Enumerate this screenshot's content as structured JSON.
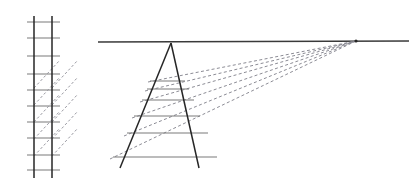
{
  "figure": {
    "type": "line-diagram",
    "canvas": {
      "width": 411,
      "height": 187,
      "background": "#ffffff"
    },
    "colors": {
      "rail": "#262626",
      "rung": "#7a7a7a",
      "horizon": "#3a3a3a",
      "construction": "#8c8c95",
      "background": "#ffffff"
    }
  },
  "orthographic_ladder": {
    "label": "elevation-view-ladder",
    "rails": [
      {
        "name": "left-rail",
        "x1": 34,
        "y1": 16,
        "x2": 34,
        "y2": 178
      },
      {
        "name": "right-rail",
        "x1": 52,
        "y1": 16,
        "x2": 52,
        "y2": 178
      }
    ],
    "rung_x_start": 27,
    "rung_x_end": 60,
    "rung_y_values": [
      22,
      38,
      56,
      74,
      90,
      106,
      122,
      138,
      155,
      170
    ],
    "diagonals": [
      {
        "x1": 34,
        "y1": 88,
        "x2": 60,
        "y2": 60
      },
      {
        "x1": 34,
        "y1": 105,
        "x2": 60,
        "y2": 77
      },
      {
        "x1": 34,
        "y1": 122,
        "x2": 60,
        "y2": 94
      },
      {
        "x1": 34,
        "y1": 139,
        "x2": 60,
        "y2": 111
      },
      {
        "x1": 34,
        "y1": 156,
        "x2": 60,
        "y2": 128
      },
      {
        "x1": 52,
        "y1": 88,
        "x2": 78,
        "y2": 60
      },
      {
        "x1": 52,
        "y1": 105,
        "x2": 78,
        "y2": 77
      },
      {
        "x1": 52,
        "y1": 122,
        "x2": 78,
        "y2": 94
      },
      {
        "x1": 52,
        "y1": 139,
        "x2": 78,
        "y2": 111
      },
      {
        "x1": 52,
        "y1": 156,
        "x2": 78,
        "y2": 128
      }
    ]
  },
  "horizon": {
    "label": "horizon-line",
    "x1": 98,
    "y1": 42,
    "x2": 409,
    "y2": 41
  },
  "vanishing_point": {
    "label": "vanishing-point",
    "x": 356,
    "y": 41
  },
  "perspective_ladder": {
    "label": "perspective-view-ladder",
    "apex": {
      "x": 171,
      "y": 43
    },
    "rails": [
      {
        "name": "left-rail-perspective",
        "x1": 171,
        "y1": 43,
        "x2": 120,
        "y2": 168
      },
      {
        "name": "right-rail-perspective",
        "x1": 171,
        "y1": 43,
        "x2": 199,
        "y2": 168
      }
    ],
    "rungs": [
      {
        "name": "rung-1",
        "x1": 150,
        "y1": 81,
        "x2": 185,
        "y2": 81
      },
      {
        "name": "rung-2",
        "x1": 147,
        "y1": 89,
        "x2": 189,
        "y2": 89
      },
      {
        "name": "rung-3",
        "x1": 142,
        "y1": 100,
        "x2": 194,
        "y2": 100
      },
      {
        "name": "rung-4",
        "x1": 134,
        "y1": 116,
        "x2": 200,
        "y2": 116
      },
      {
        "name": "rung-5",
        "x1": 127,
        "y1": 133,
        "x2": 208,
        "y2": 133
      },
      {
        "name": "rung-6",
        "x1": 113,
        "y1": 157,
        "x2": 217,
        "y2": 157
      }
    ]
  },
  "convergence_lines": {
    "label": "construction-lines-to-vanishing-point",
    "count": 5,
    "lines": [
      {
        "name": "convergence-line-1",
        "x1": 148,
        "y1": 82,
        "x2": 356,
        "y2": 41
      },
      {
        "name": "convergence-line-2",
        "x1": 145,
        "y1": 91,
        "x2": 356,
        "y2": 41
      },
      {
        "name": "convergence-line-3",
        "x1": 140,
        "y1": 102,
        "x2": 356,
        "y2": 41
      },
      {
        "name": "convergence-line-4",
        "x1": 132,
        "y1": 118,
        "x2": 356,
        "y2": 41
      },
      {
        "name": "convergence-line-5",
        "x1": 124,
        "y1": 136,
        "x2": 356,
        "y2": 41
      },
      {
        "name": "convergence-line-6",
        "x1": 110,
        "y1": 159,
        "x2": 356,
        "y2": 41
      }
    ]
  }
}
